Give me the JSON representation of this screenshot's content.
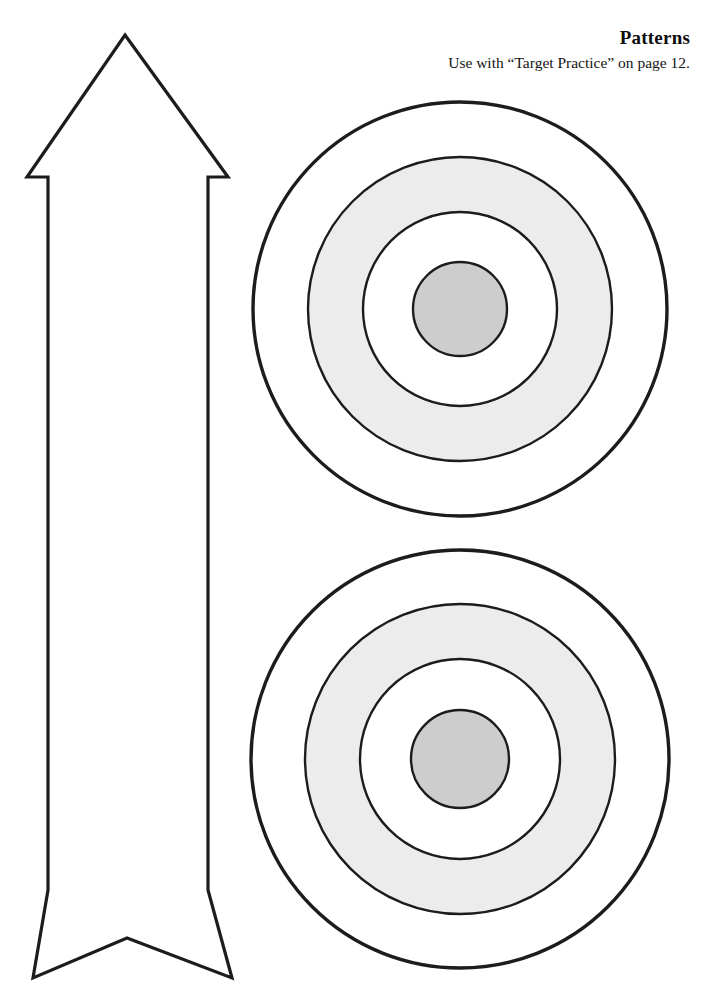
{
  "page": {
    "width": 706,
    "height": 990,
    "background": "#ffffff"
  },
  "header": {
    "title": "Patterns",
    "subtitle": "Use with “Target Practice” on page 12.",
    "reference_page_number": "12",
    "referenced_activity": "Target Practice"
  },
  "palette": {
    "outline": "#1c1c1c",
    "paper": "#ffffff",
    "ring_gray": "#ececec",
    "bullseye_gray": "#cdcdcd"
  },
  "shapes": {
    "arrow": {
      "name": "arrow-cutout",
      "label": "Arrow",
      "orientation": "up",
      "fill": "#ffffff",
      "stroke": "#1c1c1c",
      "stroke_width": 3.2,
      "points": "125,35 228,177 208,177 208,890 232,978 127,938 33,978 48,890 48,177 27,177"
    },
    "targets": [
      {
        "name": "target-top",
        "label": "Target 1",
        "cx": 460,
        "cy": 309,
        "rings": [
          {
            "name": "outer-ring",
            "r": 207,
            "fill": "#ffffff",
            "stroke_width": 3.4
          },
          {
            "name": "gray-ring",
            "r": 152,
            "fill": "#ececec",
            "stroke_width": 2.4
          },
          {
            "name": "white-ring",
            "r": 97,
            "fill": "#ffffff",
            "stroke_width": 2.4
          },
          {
            "name": "bullseye",
            "r": 47,
            "fill": "#cdcdcd",
            "stroke_width": 2.4
          }
        ]
      },
      {
        "name": "target-bottom",
        "label": "Target 2",
        "cx": 460,
        "cy": 759,
        "rings": [
          {
            "name": "outer-ring",
            "r": 209,
            "fill": "#ffffff",
            "stroke_width": 3.4
          },
          {
            "name": "gray-ring",
            "r": 155,
            "fill": "#ececec",
            "stroke_width": 2.4
          },
          {
            "name": "white-ring",
            "r": 100,
            "fill": "#ffffff",
            "stroke_width": 2.4
          },
          {
            "name": "bullseye",
            "r": 49,
            "fill": "#cdcdcd",
            "stroke_width": 2.4
          }
        ]
      }
    ]
  }
}
